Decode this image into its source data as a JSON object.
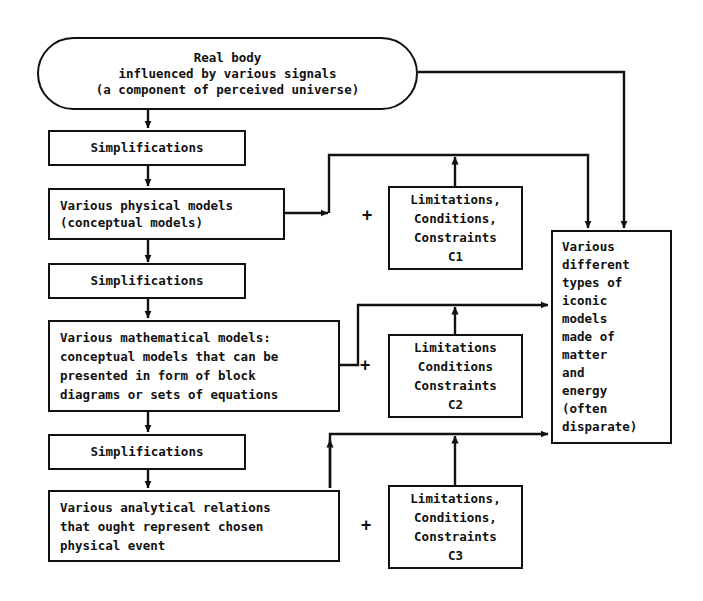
{
  "diagram": {
    "line_color": "#111111",
    "background_color": "#ffffff",
    "nodes": {
      "real_body": {
        "shape": "rounded-oval",
        "text": "Real body\ninfluenced by various signals\n(a component of perceived universe)"
      },
      "simplifications_1": {
        "shape": "rectangle",
        "text": "Simplifications"
      },
      "physical_models": {
        "shape": "rectangle",
        "text": "Various physical models\n(conceptual models)"
      },
      "simplifications_2": {
        "shape": "rectangle",
        "text": "Simplifications"
      },
      "mathematical_models": {
        "shape": "rectangle",
        "text": "Various mathematical models:\nconceptual models that can be\npresented in form of block\ndiagrams or sets of equations"
      },
      "simplifications_3": {
        "shape": "rectangle",
        "text": "Simplifications"
      },
      "analytical_relations": {
        "shape": "rectangle",
        "text": "Various analytical relations\nthat ought represent chosen\nphysical event"
      },
      "limitations_c1": {
        "shape": "rectangle",
        "text": "Limitations,\nConditions,\nConstraints\nC1"
      },
      "limitations_c2": {
        "shape": "rectangle",
        "text": "Limitations\nConditions\nConstraints\nC2"
      },
      "limitations_c3": {
        "shape": "rectangle",
        "text": "Limitations,\nConditions,\nConstraints\nC3"
      },
      "iconic_models": {
        "shape": "rectangle",
        "text": "Various\ndifferent\ntypes of\niconic\nmodels\nmade of\nmatter\nand\nenergy\n(often\ndisparate)"
      }
    },
    "operators": {
      "plus_1": "+",
      "plus_2": "+",
      "plus_3": "+"
    }
  }
}
